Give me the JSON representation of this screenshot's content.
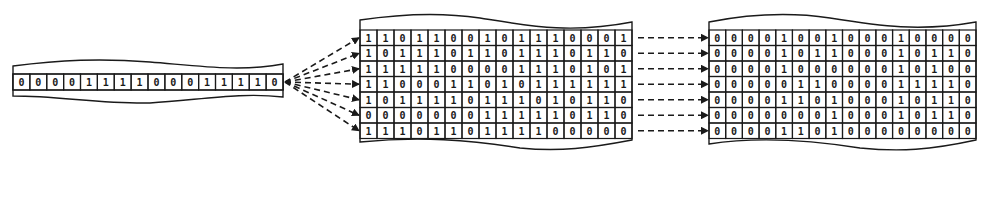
{
  "diagram": {
    "colors": {
      "ink": "#1a1a1a",
      "background": "#ffffff"
    },
    "input_strip": {
      "bits": [
        0,
        0,
        0,
        0,
        1,
        1,
        1,
        1,
        0,
        0,
        0,
        1,
        1,
        1,
        1,
        0
      ]
    },
    "operand_grid": {
      "rows": [
        [
          1,
          1,
          0,
          1,
          1,
          0,
          0,
          1,
          0,
          1,
          1,
          1,
          0,
          0,
          0,
          1
        ],
        [
          1,
          0,
          1,
          1,
          1,
          0,
          1,
          1,
          0,
          1,
          1,
          1,
          0,
          1,
          1,
          0
        ],
        [
          1,
          1,
          1,
          1,
          1,
          0,
          0,
          0,
          0,
          1,
          1,
          1,
          0,
          1,
          0,
          1
        ],
        [
          1,
          1,
          0,
          0,
          0,
          1,
          1,
          0,
          1,
          0,
          1,
          1,
          1,
          1,
          1,
          1
        ],
        [
          1,
          0,
          1,
          1,
          1,
          1,
          0,
          1,
          1,
          1,
          0,
          1,
          0,
          1,
          1,
          0
        ],
        [
          0,
          0,
          0,
          0,
          0,
          0,
          0,
          1,
          1,
          1,
          1,
          1,
          0,
          1,
          1,
          0
        ],
        [
          1,
          1,
          1,
          0,
          1,
          1,
          0,
          1,
          1,
          1,
          1,
          0,
          0,
          0,
          0,
          0
        ]
      ]
    },
    "result_grid": {
      "rows": [
        [
          0,
          0,
          0,
          0,
          1,
          0,
          0,
          1,
          0,
          0,
          0,
          1,
          0,
          0,
          0,
          0
        ],
        [
          0,
          0,
          0,
          0,
          1,
          0,
          1,
          1,
          0,
          0,
          0,
          1,
          0,
          1,
          1,
          0
        ],
        [
          0,
          0,
          0,
          0,
          1,
          0,
          0,
          0,
          0,
          0,
          0,
          1,
          0,
          1,
          0,
          0
        ],
        [
          0,
          0,
          0,
          0,
          0,
          1,
          1,
          0,
          0,
          0,
          0,
          1,
          1,
          1,
          1,
          0
        ],
        [
          0,
          0,
          0,
          0,
          1,
          1,
          0,
          1,
          0,
          0,
          0,
          1,
          0,
          1,
          1,
          0
        ],
        [
          0,
          0,
          0,
          0,
          0,
          0,
          0,
          1,
          0,
          0,
          0,
          1,
          0,
          1,
          1,
          0
        ],
        [
          0,
          0,
          0,
          0,
          1,
          1,
          0,
          1,
          0,
          0,
          0,
          0,
          0,
          0,
          0,
          0
        ]
      ]
    },
    "connectors": {
      "fan_out_count": 7,
      "row_arrow_count": 7,
      "style": "dashed-arrow"
    }
  }
}
